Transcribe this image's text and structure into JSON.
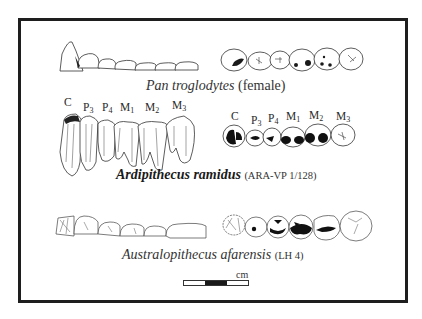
{
  "figure": {
    "rows": [
      {
        "id": "pan",
        "species": "Pan troglodytes",
        "specimen": "(female)",
        "species_bold": false
      },
      {
        "id": "ardipithecus",
        "species": "Ardipithecus ramidus",
        "specimen": "(ARA-VP 1/128)",
        "species_bold": true
      },
      {
        "id": "australopithecus",
        "species": "Australopithecus afarensis",
        "specimen": "(LH 4)",
        "species_bold": false
      }
    ],
    "tooth_labels_lateral": [
      {
        "base": "C",
        "sub": ""
      },
      {
        "base": "P",
        "sub": "3"
      },
      {
        "base": "P",
        "sub": "4"
      },
      {
        "base": "M",
        "sub": "1"
      },
      {
        "base": "M",
        "sub": "2"
      },
      {
        "base": "M",
        "sub": "3"
      }
    ],
    "tooth_labels_occlusal": [
      {
        "base": "C",
        "sub": ""
      },
      {
        "base": "P",
        "sub": "3"
      },
      {
        "base": "P",
        "sub": "4"
      },
      {
        "base": "M",
        "sub": "1"
      },
      {
        "base": "M",
        "sub": "2"
      },
      {
        "base": "M",
        "sub": "3"
      }
    ],
    "scale_bar": {
      "unit": "cm"
    },
    "colors": {
      "frame": "#1e1e1e",
      "ink": "#2a2a2a",
      "background": "#ffffff"
    }
  }
}
